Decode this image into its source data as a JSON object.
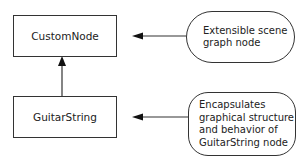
{
  "diagram": {
    "nodes": [
      {
        "id": "custom-node",
        "label": "CustomNode"
      },
      {
        "id": "guitar-string",
        "label": "GuitarString"
      }
    ],
    "callouts": [
      {
        "id": "callout-custom-node",
        "text": "Extensible scene\ngraph node"
      },
      {
        "id": "callout-guitar-string",
        "text": "Encapsulates\ngraphical structure\nand behavior of\nGuitarString node"
      }
    ],
    "edges": [
      {
        "from": "guitar-string",
        "to": "custom-node",
        "type": "inheritance-arrow"
      },
      {
        "from": "callout-custom-node",
        "to": "custom-node",
        "type": "annotation-arrow"
      },
      {
        "from": "callout-guitar-string",
        "to": "guitar-string",
        "type": "annotation-arrow"
      }
    ],
    "colors": {
      "stroke": "#333333",
      "background": "#ffffff",
      "text": "#222222"
    }
  }
}
